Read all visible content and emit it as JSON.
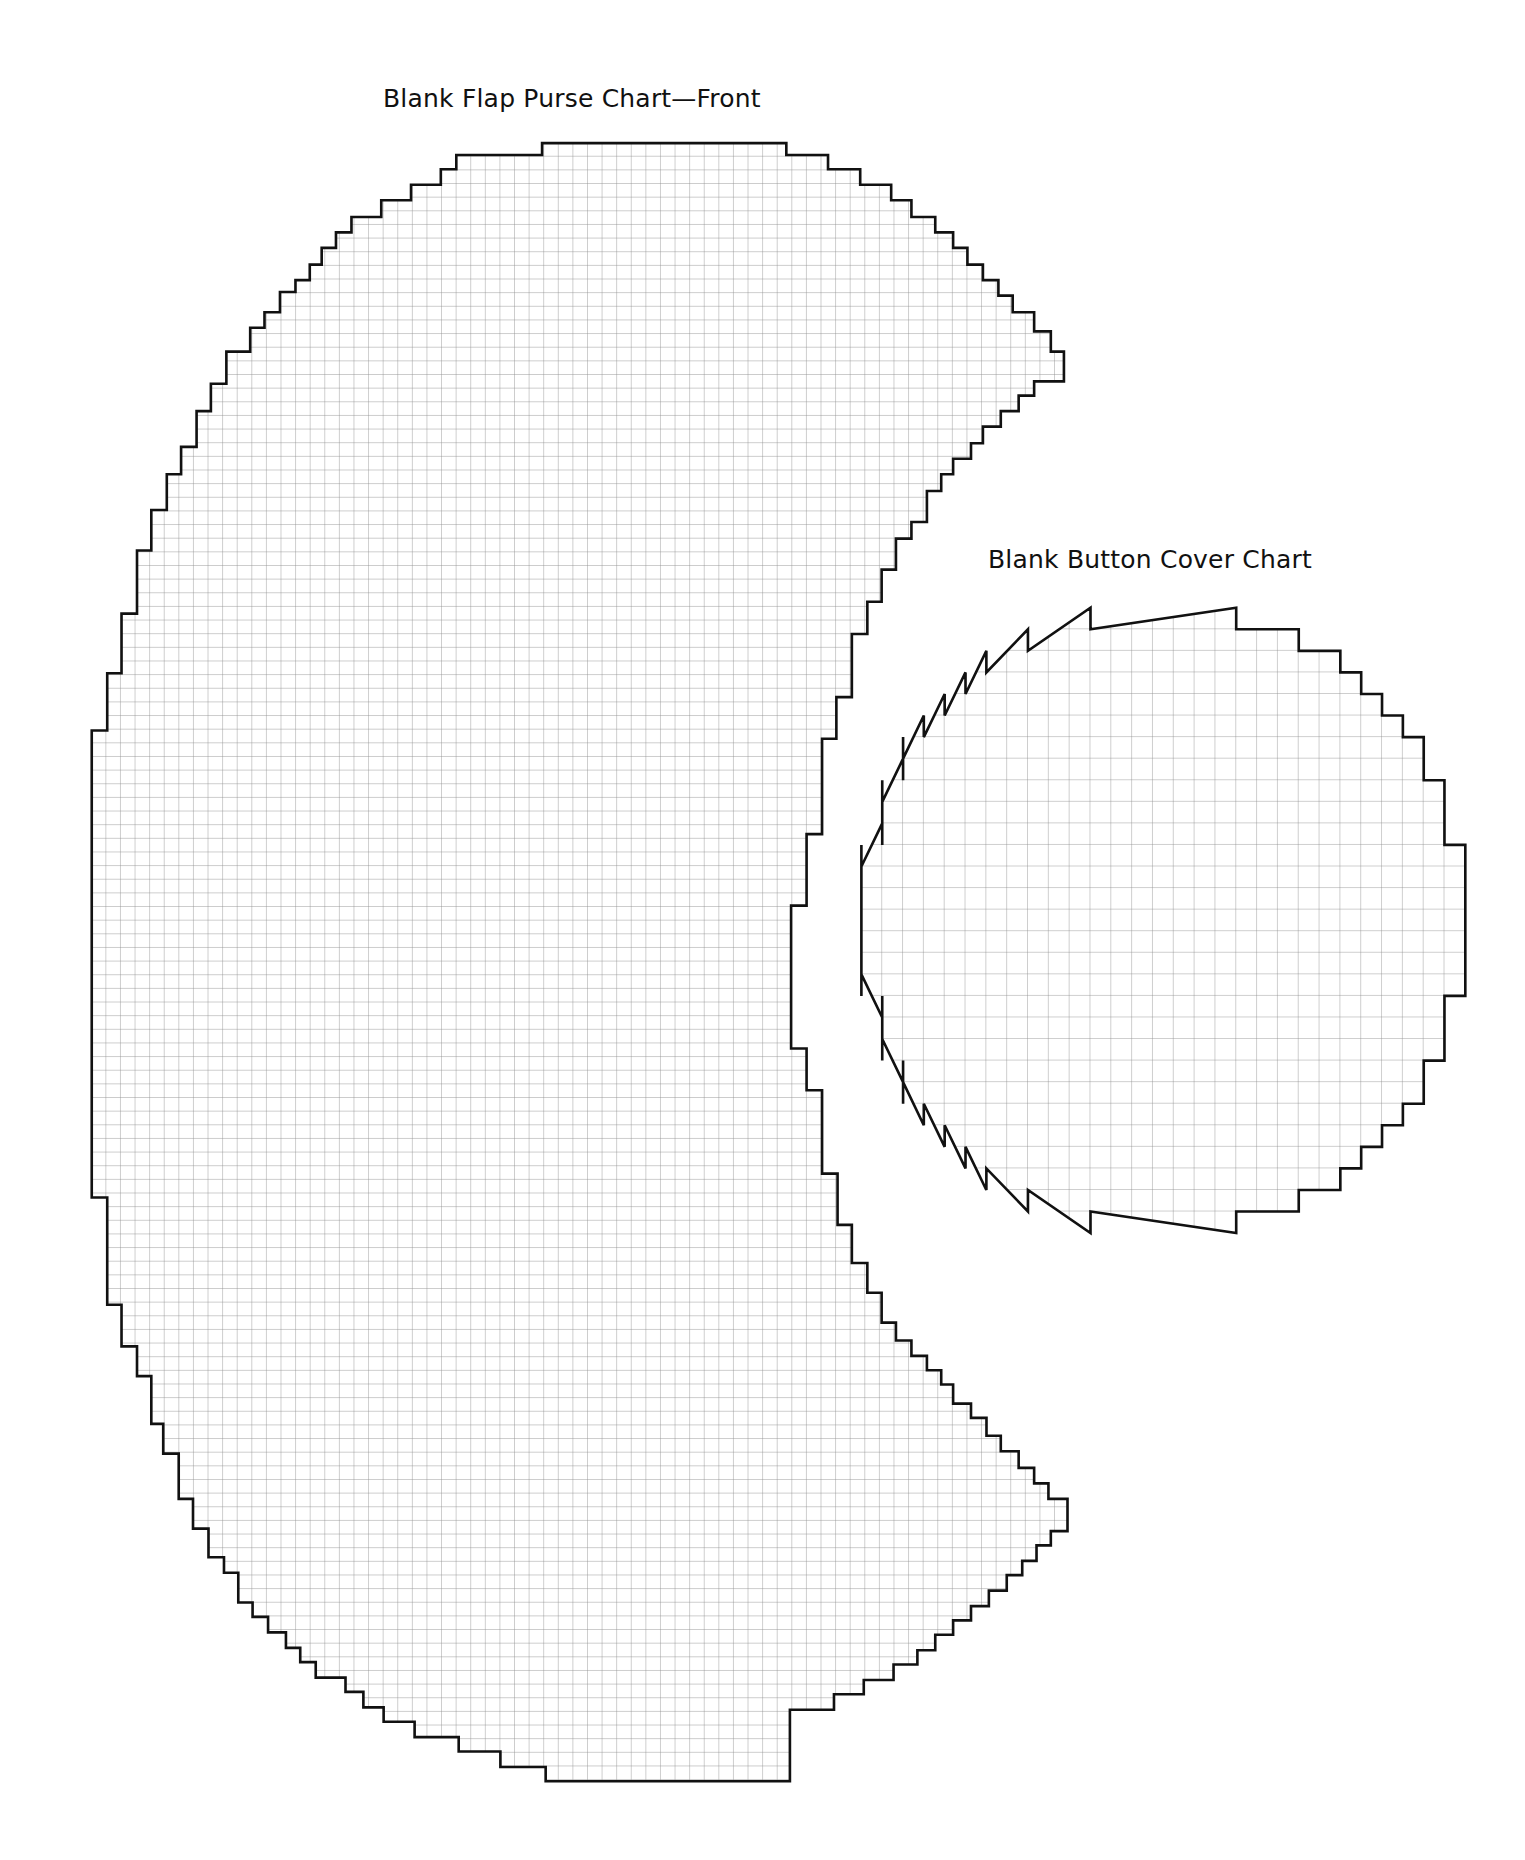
{
  "purse_chart": {
    "title": "Blank Flap Purse Chart—Front",
    "grid_color": "#8a8a8a",
    "outline_color": "#111111"
  },
  "button_chart": {
    "title": "Blank Button Cover Chart",
    "grid_columns": 29,
    "grid_rows": 29,
    "row_spans": [
      [
        11,
        18
      ],
      [
        8,
        21
      ],
      [
        6,
        23
      ],
      [
        5,
        24
      ],
      [
        4,
        25
      ],
      [
        3,
        26
      ],
      [
        2,
        27
      ],
      [
        2,
        27
      ],
      [
        1,
        28
      ],
      [
        1,
        28
      ],
      [
        1,
        28
      ],
      [
        0,
        29
      ],
      [
        0,
        29
      ],
      [
        0,
        29
      ],
      [
        0,
        29
      ],
      [
        0,
        29
      ],
      [
        0,
        29
      ],
      [
        0,
        29
      ],
      [
        1,
        28
      ],
      [
        1,
        28
      ],
      [
        1,
        28
      ],
      [
        2,
        27
      ],
      [
        2,
        27
      ],
      [
        3,
        26
      ],
      [
        4,
        25
      ],
      [
        5,
        24
      ],
      [
        6,
        23
      ],
      [
        8,
        21
      ],
      [
        11,
        18
      ]
    ]
  },
  "chart_data": [
    {
      "type": "table",
      "title": "Blank Flap Purse Chart—Front",
      "description": "Blank stitch grid in crescent / flap shape, approx. 67 columns x 120 rows",
      "grid": true
    },
    {
      "type": "table",
      "title": "Blank Button Cover Chart",
      "description": "Blank stitch grid in circular shape, 29 columns x 29 rows",
      "grid": true
    }
  ]
}
